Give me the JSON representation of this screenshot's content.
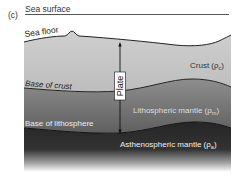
{
  "figure": {
    "panel_label": "(c)",
    "labels": {
      "sea_surface": "Sea surface",
      "sea_floor": "Sea floor",
      "base_of_crust": "Base of crust",
      "base_of_lithosphere": "Base of lithosphere",
      "plate": "Plate"
    },
    "layers": [
      {
        "name": "Crust",
        "label": "Crust (ρc)",
        "text": "Crust (",
        "sub": "c",
        "close": ")",
        "color": "#c2c2c2"
      },
      {
        "name": "Lithospheric mantle",
        "label": "Lithospheric mantle (ρm)",
        "text": "Lithospheric mantle (",
        "sub": "m",
        "close": ")",
        "color": "#7a7a7a"
      },
      {
        "name": "Asthenospheric mantle",
        "label": "Asthenospheric mantle (ρa)",
        "text": "Asthenospheric mantle (",
        "sub": "a",
        "close": ")",
        "color": "#2e2e2e"
      }
    ],
    "rho": "ρ"
  }
}
